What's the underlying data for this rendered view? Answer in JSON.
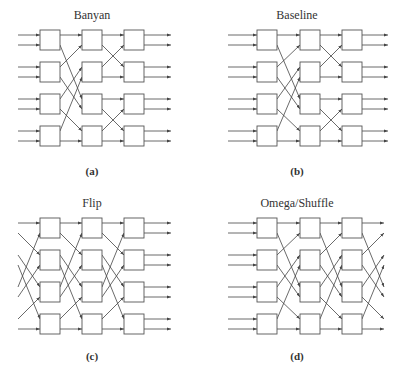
{
  "figure": {
    "panels": [
      {
        "id": "a",
        "title": "Banyan",
        "caption": "(a)",
        "origin": {
          "x": 0,
          "y": 0
        },
        "title_pos": {
          "x": 92,
          "y": 19
        },
        "caption_pos": {
          "x": 92,
          "y": 175
        },
        "input_x": 18,
        "input_style": "banyan",
        "col_x": [
          40,
          82,
          124
        ],
        "output_end_x": 171,
        "output_style": "straight",
        "stages": [
          [
            0,
            1,
            2,
            3,
            4,
            5,
            6,
            7
          ],
          [
            0,
            4,
            1,
            5,
            2,
            6,
            3,
            7
          ],
          [
            0,
            2,
            1,
            3,
            4,
            6,
            5,
            7
          ]
        ]
      },
      {
        "id": "b",
        "title": "Baseline",
        "caption": "(b)",
        "origin": {
          "x": 0,
          "y": 0
        },
        "title_pos": {
          "x": 297,
          "y": 19
        },
        "caption_pos": {
          "x": 297,
          "y": 175
        },
        "input_x": 228,
        "input_style": "straight",
        "col_x": [
          257,
          300,
          342
        ],
        "output_end_x": 388,
        "output_style": "straight",
        "stages": [
          [
            0,
            1,
            2,
            3,
            4,
            5,
            6,
            7
          ],
          [
            0,
            4,
            1,
            5,
            2,
            6,
            3,
            7
          ],
          [
            0,
            2,
            1,
            3,
            4,
            6,
            5,
            7
          ]
        ]
      },
      {
        "id": "c",
        "title": "Flip",
        "caption": "(c)",
        "origin": {
          "x": 0,
          "y": 188
        },
        "title_pos": {
          "x": 92,
          "y": 207
        },
        "caption_pos": {
          "x": 92,
          "y": 360
        },
        "input_x": 18,
        "input_style": "shuffle",
        "col_x": [
          40,
          82,
          124
        ],
        "output_end_x": 171,
        "output_style": "straight",
        "stages": [
          [
            0,
            2,
            4,
            6,
            1,
            3,
            5,
            7
          ],
          [
            0,
            2,
            4,
            6,
            1,
            3,
            5,
            7
          ],
          [
            0,
            2,
            4,
            6,
            1,
            3,
            5,
            7
          ]
        ]
      },
      {
        "id": "d",
        "title": "Omega/Shuffle",
        "caption": "(d)",
        "origin": {
          "x": 0,
          "y": 188
        },
        "title_pos": {
          "x": 297,
          "y": 207
        },
        "caption_pos": {
          "x": 297,
          "y": 360
        },
        "input_x": 228,
        "input_style": "straight",
        "col_x": [
          257,
          300,
          342
        ],
        "output_end_x": 384,
        "output_style": "inverse-shuffle",
        "stages": [
          [
            0,
            1,
            2,
            3,
            4,
            5,
            6,
            7
          ],
          [
            0,
            4,
            1,
            5,
            2,
            6,
            3,
            7
          ],
          [
            0,
            4,
            1,
            5,
            2,
            6,
            3,
            7
          ]
        ],
        "output_map": [
          0,
          4,
          1,
          5,
          2,
          6,
          3,
          7
        ]
      }
    ],
    "layout": {
      "row_y": [
        30,
        62,
        94,
        126
      ],
      "box_size": 20,
      "port_offset": [
        5,
        15
      ]
    },
    "colors": {
      "line": "#444444",
      "box_stroke": "#555555",
      "text": "#333333",
      "background": "#ffffff"
    }
  }
}
